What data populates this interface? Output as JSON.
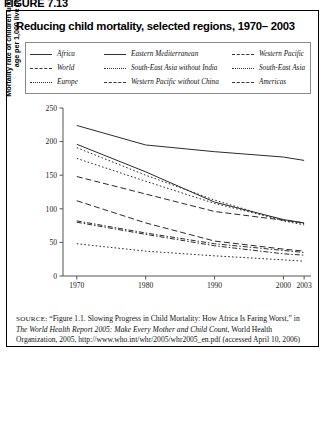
{
  "figure": {
    "label": "FIGURE 7.13",
    "title": "Reducing child mortality, selected regions, 1970– 2003"
  },
  "legend": {
    "rows": [
      [
        {
          "label": "Africa",
          "style": "solid"
        },
        {
          "label": "Eastern Mediterranean",
          "style": "solid"
        },
        {
          "label": "Western Pacific",
          "style": "dash"
        }
      ],
      [
        {
          "label": "World",
          "style": "dash"
        },
        {
          "label": "South-East Asia without India",
          "style": "dot"
        },
        {
          "label": "South-East Asia",
          "style": "dot"
        }
      ],
      [
        {
          "label": "Europe",
          "style": "dot"
        },
        {
          "label": "Western Pacific without China",
          "style": "dashdot"
        },
        {
          "label": "Americas",
          "style": "dashdot"
        }
      ]
    ]
  },
  "axes": {
    "ylabel_line1": "Mortality rate of children under 5 years of",
    "ylabel_line2": "age per 1,000 live births",
    "yticks": [
      "0",
      "50",
      "100",
      "150",
      "200",
      "250"
    ],
    "xticks": [
      "1970",
      "1980",
      "1990",
      "2000",
      "2003"
    ]
  },
  "source": {
    "prefix": "SOURCE:",
    "text1": " “Figure 1.1. Slowing Progress in Child Mortality: How Africa Is Faring Worst,” in ",
    "italic1": "The World Health Report 2005: Make Every Mother and Child Count",
    "text2": ", World Health Organization, 2005, http://www.who.int/whr/2005/whr2005_en.pdf (accessed April 10, 2006)"
  },
  "chart_data": {
    "type": "line",
    "title": "Reducing child mortality, selected regions, 1970– 2003",
    "xlabel": "",
    "ylabel": "Mortality rate of children under 5 years of age per 1,000 live births",
    "x": [
      1970,
      1980,
      1990,
      2000,
      2003
    ],
    "xlim": [
      1968,
      2004
    ],
    "ylim": [
      0,
      250
    ],
    "ytick_values": [
      0,
      50,
      100,
      150,
      200,
      250
    ],
    "xtick_values": [
      1970,
      1980,
      1990,
      2000,
      2003
    ],
    "grid": false,
    "legend_position": "top",
    "series": [
      {
        "name": "Africa",
        "style": "solid",
        "values": [
          224,
          195,
          185,
          177,
          172
        ]
      },
      {
        "name": "World",
        "style": "dash",
        "values": [
          148,
          122,
          96,
          83,
          79
        ]
      },
      {
        "name": "Europe",
        "style": "dot",
        "values": [
          48,
          37,
          30,
          24,
          22
        ]
      },
      {
        "name": "Eastern Mediterranean",
        "style": "solid",
        "values": [
          196,
          155,
          110,
          84,
          79
        ]
      },
      {
        "name": "South-East Asia without India",
        "style": "dot",
        "values": [
          191,
          150,
          113,
          82,
          76
        ]
      },
      {
        "name": "Western Pacific without China",
        "style": "dashdot",
        "values": [
          82,
          64,
          48,
          38,
          35
        ]
      },
      {
        "name": "Western Pacific",
        "style": "dash",
        "values": [
          112,
          79,
          52,
          40,
          37
        ]
      },
      {
        "name": "South-East Asia",
        "style": "dot",
        "values": [
          175,
          141,
          108,
          83,
          78
        ]
      },
      {
        "name": "Americas",
        "style": "dashdot",
        "values": [
          80,
          62,
          45,
          33,
          31
        ]
      }
    ]
  }
}
